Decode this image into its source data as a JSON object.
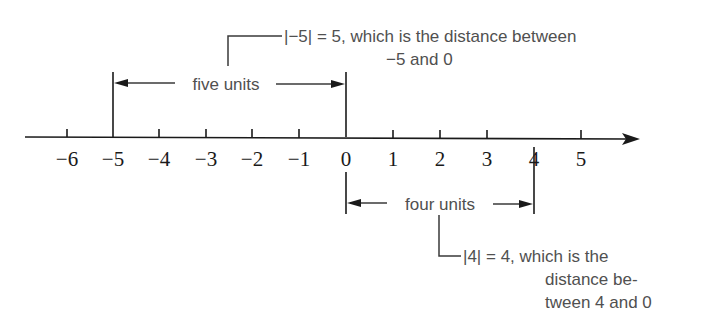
{
  "number_line": {
    "ticks": [
      {
        "value": -6,
        "label": "−6",
        "x": 67
      },
      {
        "value": -5,
        "label": "−5",
        "x": 113
      },
      {
        "value": -4,
        "label": "−4",
        "x": 159
      },
      {
        "value": -3,
        "label": "−3",
        "x": 206
      },
      {
        "value": -2,
        "label": "−2",
        "x": 252
      },
      {
        "value": -1,
        "label": "−1",
        "x": 299
      },
      {
        "value": 0,
        "label": "0",
        "x": 346
      },
      {
        "value": 1,
        "label": "1",
        "x": 393
      },
      {
        "value": 2,
        "label": "2",
        "x": 440
      },
      {
        "value": 3,
        "label": "3",
        "x": 487
      },
      {
        "value": 4,
        "label": "4",
        "x": 534
      },
      {
        "value": 5,
        "label": "5",
        "x": 581
      }
    ]
  },
  "brackets": {
    "five": {
      "label": "five units",
      "from": -5,
      "to": 0
    },
    "four": {
      "label": "four units",
      "from": 0,
      "to": 4
    }
  },
  "callouts": {
    "neg5": {
      "line1": "|−5| = 5, which is the distance between",
      "line2": "−5 and 0"
    },
    "pos4": {
      "line1": "|4| = 4, which is the",
      "line2": "distance be-",
      "line3": "tween 4 and 0"
    }
  }
}
